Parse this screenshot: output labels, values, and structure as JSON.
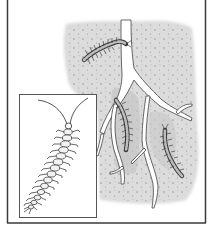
{
  "figure": {
    "frame": {
      "left_x": 7,
      "right_x": 205,
      "bottom_y": 223,
      "top_border": false,
      "color": "#3a3a3a"
    },
    "soil_region": {
      "fill": "#d9d9d9",
      "speckle": "#8a8a8a"
    },
    "roots": {
      "fill": "#ffffff",
      "stroke": "#444444"
    },
    "centipedes_in_soil": [
      {
        "label": "centipede-upper",
        "position": "upper-center"
      },
      {
        "label": "centipede-middle",
        "position": "center"
      },
      {
        "label": "centipede-lower-right",
        "position": "lower-right"
      }
    ],
    "inset": {
      "label": "enlarged-centipede",
      "x": 19,
      "y": 94,
      "width": 77,
      "height": 123,
      "border": "#555555"
    },
    "colors": {
      "ink": "#2b2b2b",
      "background": "#ffffff"
    }
  }
}
